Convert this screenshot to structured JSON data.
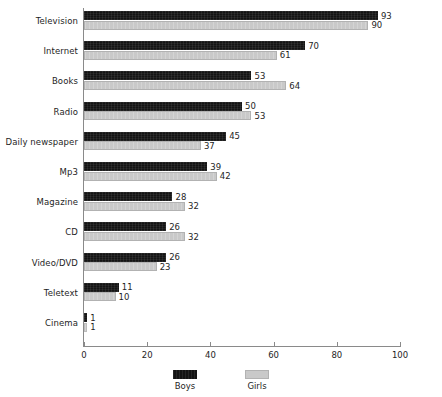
{
  "chart_data": {
    "type": "bar",
    "orientation": "horizontal",
    "title": "",
    "subtitle": "",
    "xlabel": "",
    "ylabel": "",
    "xlim": [
      0,
      100
    ],
    "xticks": [
      0,
      20,
      40,
      60,
      80,
      100
    ],
    "grid": false,
    "legend_position": "bottom-center",
    "categories": [
      "Television",
      "Internet",
      "Books",
      "Radio",
      "Daily newspaper",
      "Mp3",
      "Magazine",
      "CD",
      "Video/DVD",
      "Teletext",
      "Cinema"
    ],
    "series": [
      {
        "name": "Boys",
        "color": "#141414",
        "values": [
          93,
          70,
          53,
          50,
          45,
          39,
          28,
          26,
          26,
          11,
          1
        ]
      },
      {
        "name": "Girls",
        "color": "#c9c9c9",
        "values": [
          90,
          61,
          64,
          53,
          37,
          42,
          32,
          32,
          23,
          10,
          1
        ]
      }
    ]
  },
  "legend": {
    "items": [
      {
        "label": "Boys",
        "swatch": "boys"
      },
      {
        "label": "Girls",
        "swatch": "girls"
      }
    ]
  }
}
